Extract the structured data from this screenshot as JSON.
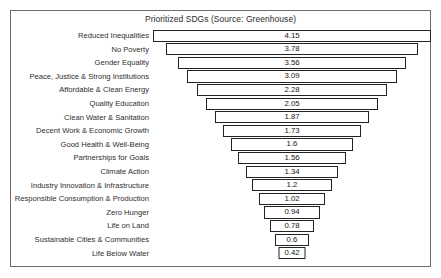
{
  "chart_data": {
    "type": "bar",
    "subtype": "funnel",
    "title": "Prioritized SDGs (Source: Greenhouse)",
    "xlabel": "",
    "ylabel": "",
    "orientation": "horizontal",
    "grid": false,
    "legend": false,
    "categories": [
      "Reduced Inequalities",
      "No Poverty",
      "Gender Equality",
      "Peace, Justice & Strong Institutions",
      "Affordable & Clean Energy",
      "Quality Education",
      "Clean Water & Sanitation",
      "Decent Work & Economic Growth",
      "Good Health & Well-Being",
      "Partnerships for Goals",
      "Climate Action",
      "Industry Innovation & Infrastructure",
      "Responsible Consumption & Production",
      "Zero Hunger",
      "Life on Land",
      "Sustainable Cities & Communities",
      "Life Below Water"
    ],
    "values": [
      4.15,
      3.78,
      3.56,
      3.09,
      2.28,
      2.05,
      1.87,
      1.73,
      1.6,
      1.56,
      1.34,
      1.2,
      1.02,
      0.94,
      0.78,
      0.6,
      0.42
    ],
    "value_labels": [
      "4.15",
      "3.78",
      "3.56",
      "3.09",
      "2.28",
      "2.05",
      "1.87",
      "1.73",
      "1.6",
      "1.56",
      "1.34",
      "1.2",
      "1.02",
      "0.94",
      "0.78",
      "0.6",
      "0.42"
    ],
    "bar_widths_px": [
      278,
      252,
      228,
      210,
      190,
      172,
      154,
      138,
      122,
      108,
      92,
      80,
      66,
      56,
      44,
      34,
      27
    ],
    "ylim": [
      0,
      4.15
    ],
    "colors": {
      "bar_fill": "#ffffff",
      "bar_outline": "#232323",
      "frame": "#6e6e6e",
      "background": "#ffffff",
      "label_text": "#2e2e2e",
      "value_text": "#161616"
    }
  }
}
